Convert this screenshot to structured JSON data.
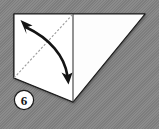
{
  "figure": {
    "kind": "origami-fold-diagram",
    "title": "Origami fold step diagram",
    "canvas": {
      "width": 159,
      "height": 129
    },
    "background_color": "#848484",
    "paper_color": "#ffffff",
    "line_color": "#1a1a1a",
    "crease_color": "#8e8e8e",
    "step_label": "6",
    "shapes": {
      "paper_outline": {
        "name": "paper-polygon",
        "points": "14,14 145,14 73,102 14,78"
      },
      "left_flap": {
        "name": "left-flap-polygon",
        "points": "14,14 73,14 73,102 14,78"
      },
      "right_flap": {
        "name": "right-flap-polygon",
        "points": "73,14 145,14 73,102"
      }
    },
    "lines": {
      "vertical_fold": {
        "name": "vertical-fold-line",
        "x1": 73,
        "y1": 14,
        "x2": 73,
        "y2": 102
      },
      "diagonal_crease": {
        "name": "diagonal-crease-line",
        "x1": 14,
        "y1": 78,
        "x2": 73,
        "y2": 14,
        "style": "dashed"
      }
    },
    "arrow": {
      "name": "double-headed-fold-arrow",
      "path": "M 25,26 C 52,38 66,56 68,76",
      "head_top": {
        "x": 22,
        "y": 21,
        "angle": -135
      },
      "head_bottom": {
        "x": 68,
        "y": 82,
        "angle": 80
      },
      "direction": "both"
    },
    "badge": {
      "name": "step-number-badge",
      "cx": 24,
      "cy": 100,
      "r": 10,
      "fill": "#ffffff",
      "stroke": "#1a1a1a"
    }
  }
}
